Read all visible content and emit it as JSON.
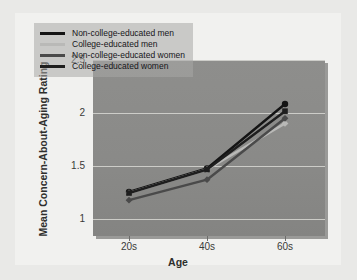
{
  "chart_data": {
    "type": "line",
    "title": "",
    "xlabel": "Age",
    "ylabel": "Mean Concern-About-Aging Rating",
    "categories": [
      "20s",
      "40s",
      "60s"
    ],
    "xticklabels": [
      "20s",
      "40s",
      "60s"
    ],
    "yticklabels": [
      "1",
      "1.5",
      "2",
      "2.5"
    ],
    "ytickvalues": [
      1,
      1.5,
      2,
      2.5
    ],
    "ylim": [
      0.78,
      2.5
    ],
    "grid": true,
    "legend_position": "upper left",
    "series": [
      {
        "name": "Non-college-educated men",
        "color": "#141414",
        "marker": "circle",
        "values": [
          1.21,
          1.44,
          2.07
        ]
      },
      {
        "name": "College-educated men",
        "color": "#b9b9b7",
        "marker": "diamond",
        "values": [
          1.2,
          1.43,
          1.88
        ]
      },
      {
        "name": "Non-college-educated women",
        "color": "#4a4a4a",
        "marker": "diamond",
        "values": [
          1.13,
          1.33,
          1.93
        ]
      },
      {
        "name": "College-educated women",
        "color": "#1e1e1e",
        "marker": "square",
        "values": [
          1.2,
          1.43,
          2.0
        ]
      }
    ]
  },
  "colors": {
    "page_background": "#e9e9e7",
    "figure_background": "#f1f1ef",
    "plot_background": "#8a8a88",
    "gridline": "#d8d8d4",
    "legend_background": "#a8a8a6",
    "text": "#2e2e2c"
  }
}
